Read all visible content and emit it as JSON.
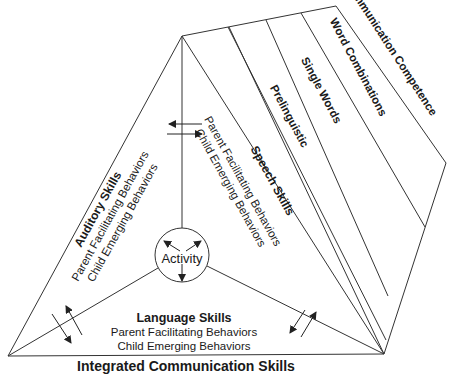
{
  "diagram": {
    "title": "Integrated Communication Skills",
    "center": {
      "label": "Activity"
    },
    "faces": [
      {
        "id": "auditory",
        "title": "Auditory Skills",
        "lines": [
          "Parent Facilitating Behaviors",
          "Child Emerging Behaviors"
        ]
      },
      {
        "id": "speech",
        "title": "Speech Skills",
        "lines": [
          "Parent Facilitating Behaviors",
          "Child Emerging Behaviors"
        ]
      },
      {
        "id": "language",
        "title": "Language Skills",
        "lines": [
          "Parent Facilitating Behaviors",
          "Child Emerging Behaviors"
        ]
      }
    ],
    "stages": [
      "Prelinguistic",
      "Single Words",
      "Word Combinations",
      "Communication Competence"
    ],
    "colors": {
      "line": "#333333",
      "text": "#1a1a1a",
      "background": "#ffffff"
    }
  }
}
